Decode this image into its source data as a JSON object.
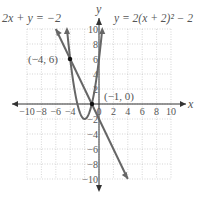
{
  "chart_data": {
    "type": "line",
    "title": "",
    "xlabel": "x",
    "ylabel": "y",
    "xlim": [
      -10,
      10
    ],
    "ylim": [
      -10,
      10
    ],
    "grid": true,
    "x_ticks": [
      "−10",
      "−8",
      "−6",
      "−4",
      "−2",
      "0",
      "2",
      "4",
      "6",
      "8",
      "10"
    ],
    "y_ticks": [
      "10",
      "8",
      "6",
      "4",
      "2",
      "−2",
      "−4",
      "−6",
      "−8",
      "−10"
    ],
    "series": [
      {
        "name": "2x + y = −2",
        "equation": "y = -2x - 2",
        "x": [
          -6,
          4
        ],
        "y": [
          10,
          -10
        ]
      },
      {
        "name": "y = 2(x + 2)² − 2",
        "equation": "y = 2(x+2)^2 - 2",
        "vertex": [
          -2,
          -2
        ]
      }
    ],
    "annotations": [
      {
        "text": "(−4, 6)",
        "x": -4,
        "y": 6
      },
      {
        "text": "(−1, 0)",
        "x": -1,
        "y": 0
      }
    ]
  },
  "labels": {
    "line_eq": "2x + y = −2",
    "parabola_eq": "y = 2(x + 2)² − 2",
    "point1": "(−4, 6)",
    "point2": "(−1, 0)",
    "x_axis": "x",
    "y_axis": "y"
  }
}
